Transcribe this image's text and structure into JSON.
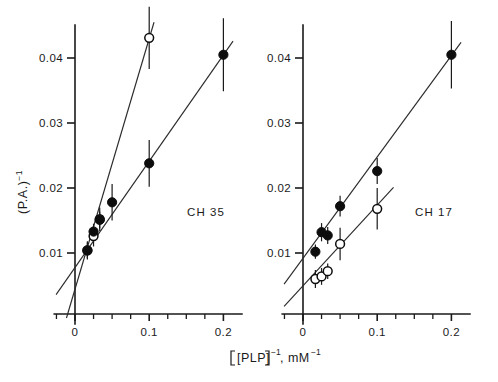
{
  "figure": {
    "axis_titles": {
      "x_main": "[PLP]",
      "x_exp1": "−1",
      "x_mid": ", mM",
      "x_exp2": "−1",
      "y_main": "(P.A.)",
      "y_exp": "−1"
    }
  },
  "chart_data": {
    "type": "scatter",
    "title": "",
    "subtitle": "",
    "xlabel": "[PLP]^-1, mM^-1",
    "ylabel": "(P.A.)^-1",
    "grid": false,
    "legend": "none",
    "panels": [
      {
        "id": "panel-left",
        "label": "CH 35",
        "xlim": [
          -0.028,
          0.225
        ],
        "ylim": [
          0.0,
          0.0475
        ],
        "xticks_major": [
          0,
          0.1,
          0.2
        ],
        "xticks_major_labels": [
          "0",
          "0.1",
          "0.2"
        ],
        "xticks_minor": [
          -0.025,
          0.025,
          0.05,
          0.075,
          0.125,
          0.15,
          0.175
        ],
        "yticks_major": [
          0.01,
          0.02,
          0.03,
          0.04
        ],
        "yticks_major_labels": [
          "0.01",
          "0.02",
          "0.03",
          "0.04"
        ],
        "series": [
          {
            "name": "open-circles",
            "marker": "open",
            "x": [
              0.0167,
              0.025,
              0.0333,
              0.1
            ],
            "y": [
              0.0104,
              0.0126,
              0.0152,
              0.0431
            ],
            "yerr": [
              0.0012,
              0.0016,
              0.0018,
              0.0048
            ],
            "fit_x": [
              -0.0115,
              0.1065
            ],
            "fit_y": [
              0.0,
              0.0455
            ]
          },
          {
            "name": "filled-circles",
            "marker": "filled",
            "x": [
              0.0167,
              0.025,
              0.0333,
              0.05,
              0.1,
              0.2
            ],
            "y": [
              0.0104,
              0.0133,
              0.0151,
              0.0178,
              0.0238,
              0.0405
            ],
            "yerr": [
              0.0014,
              0.0012,
              0.0013,
              0.0028,
              0.0036,
              0.0056
            ],
            "fit_x": [
              -0.0255,
              0.213
            ],
            "fit_y": [
              0.0036,
              0.0426
            ]
          }
        ]
      },
      {
        "id": "panel-right",
        "label": "CH 17",
        "xlim": [
          -0.028,
          0.225
        ],
        "ylim": [
          0.0,
          0.0475
        ],
        "xticks_major": [
          0,
          0.1,
          0.2
        ],
        "xticks_major_labels": [
          "0",
          "0.1",
          "0.2"
        ],
        "xticks_minor": [
          -0.025,
          0.025,
          0.05,
          0.075,
          0.125,
          0.15,
          0.175
        ],
        "yticks_major": [
          0.01,
          0.02,
          0.03,
          0.04
        ],
        "yticks_major_labels": [
          "0.01",
          "0.02",
          "0.03",
          "0.04"
        ],
        "series": [
          {
            "name": "filled-circles",
            "marker": "filled",
            "x": [
              0.0167,
              0.025,
              0.0333,
              0.05,
              0.1,
              0.2
            ],
            "y": [
              0.0102,
              0.0132,
              0.0127,
              0.0172,
              0.0226,
              0.0405
            ],
            "yerr": [
              0.0011,
              0.0014,
              0.0013,
              0.0016,
              0.002,
              0.0052
            ],
            "fit_x": [
              -0.0255,
              0.213
            ],
            "fit_y": [
              0.0052,
              0.0424
            ]
          },
          {
            "name": "open-circles",
            "marker": "open",
            "x": [
              0.0167,
              0.025,
              0.0333,
              0.05,
              0.1
            ],
            "y": [
              0.006,
              0.0064,
              0.0072,
              0.0114,
              0.0168
            ],
            "yerr": [
              0.0014,
              0.0013,
              0.0012,
              0.0025,
              0.0032
            ],
            "fit_x": [
              -0.0255,
              0.122
            ],
            "fit_y": [
              0.0018,
              0.0201
            ]
          }
        ]
      }
    ]
  }
}
